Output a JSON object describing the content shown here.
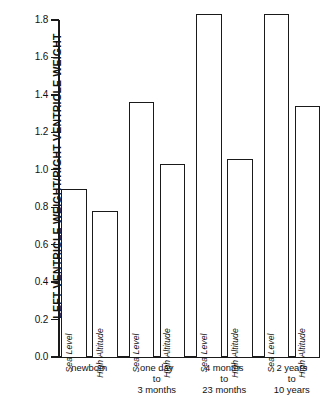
{
  "chart_data": {
    "type": "bar",
    "title": "",
    "xlabel": "",
    "ylabel": "LEFT VENTRICLE WEIGHT/RIGHT VENTRICLE WEIGHT",
    "ylim": [
      0.0,
      1.8
    ],
    "ytick_labels": [
      "1.8",
      "1.6",
      "1.4",
      "1.2",
      "1.0",
      "0.8",
      "0.6",
      "0.4",
      "0.2",
      "0.0"
    ],
    "ytick_values": [
      1.8,
      1.6,
      1.4,
      1.2,
      1.0,
      0.8,
      0.6,
      0.4,
      0.2,
      0.0
    ],
    "grid": false,
    "legend": "none",
    "categories": [
      "newborn",
      "one day to 3 months",
      "4 months to 23 months",
      "2 years to 10 years"
    ],
    "series": [
      {
        "name": "Sea Level",
        "values": [
          0.9,
          1.36,
          1.83,
          1.83
        ]
      },
      {
        "name": "High Altitude",
        "values": [
          0.78,
          1.03,
          1.06,
          1.34
        ]
      }
    ],
    "bars": [
      {
        "group": "newborn",
        "condition": "Sea Level",
        "value": 0.9
      },
      {
        "group": "newborn",
        "condition": "High Altitude",
        "value": 0.78
      },
      {
        "group": "one day to 3 months",
        "condition": "Sea Level",
        "value": 1.36
      },
      {
        "group": "one day to 3 months",
        "condition": "High Altitude",
        "value": 1.03
      },
      {
        "group": "4 months to 23 months",
        "condition": "Sea Level",
        "value": 1.83
      },
      {
        "group": "4 months to 23 months",
        "condition": "High Altitude",
        "value": 1.06
      },
      {
        "group": "2 years to 10 years",
        "condition": "Sea Level",
        "value": 1.83
      },
      {
        "group": "2 years to 10 years",
        "condition": "High Altitude",
        "value": 1.34
      }
    ],
    "group_label_lines": [
      [
        "newborn"
      ],
      [
        "one day",
        "to",
        "3 months"
      ],
      [
        "4 months",
        "to",
        "23 months"
      ],
      [
        "2 years",
        "to",
        "10 years"
      ]
    ],
    "colors": {
      "bar_fill": "#ffffff",
      "bar_outline": "#1a1a1a",
      "axis": "#1a1a1a",
      "text": "#111111",
      "background": "#ffffff"
    }
  }
}
